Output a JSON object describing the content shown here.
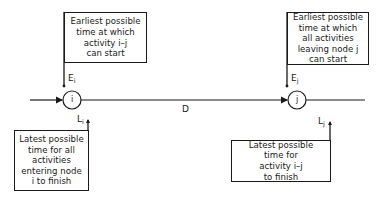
{
  "diagram": {
    "type": "activity-on-arrow network notation",
    "nodes": [
      {
        "id": "i",
        "label": "i"
      },
      {
        "id": "j",
        "label": "j"
      }
    ],
    "activity": {
      "from": "i",
      "to": "j",
      "duration_label": "D"
    },
    "labels": {
      "e_i": {
        "main": "E",
        "sub": "i"
      },
      "e_j": {
        "main": "E",
        "sub": "j"
      },
      "l_i": {
        "main": "L",
        "sub": "i"
      },
      "l_j": {
        "main": "L",
        "sub": "j"
      }
    },
    "boxes": {
      "top_left": "Earliest possible\ntime at which\nactivity i–j\ncan start",
      "top_right": "Earliest possible\ntime at which\nall activities\nleaving node j\ncan start",
      "bottom_left": "Latest possible\ntime for all\nactivities\nentering node\ni to finish",
      "bottom_right": "Latest possible\ntime for\nactivity i–j\nto finish"
    },
    "colors": {
      "ink": "#1a1a1a",
      "background": "#ffffff"
    }
  }
}
